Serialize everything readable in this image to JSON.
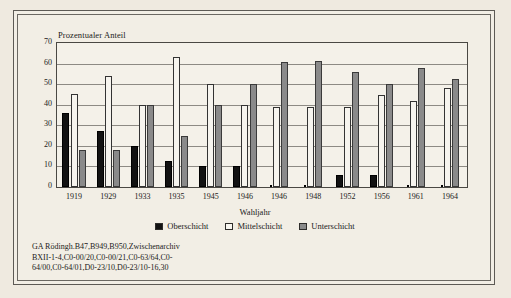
{
  "chart_data": {
    "type": "bar",
    "title": "",
    "ylabel": "Prozentualer Anteil",
    "xlabel": "Wahljahr",
    "ylim": [
      0,
      70
    ],
    "yticks": [
      70,
      60,
      50,
      40,
      30,
      20,
      10,
      0
    ],
    "grid": true,
    "legend_position": "bottom",
    "categories": [
      "1919",
      "1929",
      "1933",
      "1935",
      "1945",
      "1946",
      "1946",
      "1948",
      "1952",
      "1956",
      "1961",
      "1964"
    ],
    "series": [
      {
        "name": "Oberschicht",
        "color": "#121212",
        "values": [
          36,
          27,
          20,
          12.5,
          10,
          10,
          0,
          0,
          6,
          6,
          0,
          0
        ]
      },
      {
        "name": "Mittelschicht",
        "color": "#f6f4ee",
        "values": [
          45,
          54,
          40,
          63,
          50,
          40,
          39,
          39,
          39,
          44.5,
          42,
          48
        ]
      },
      {
        "name": "Unterschicht",
        "color": "#8a8a8a",
        "values": [
          18,
          18,
          40,
          25,
          40,
          50,
          61,
          61.5,
          56,
          50,
          58,
          52.5
        ]
      }
    ]
  },
  "caption": {
    "lines": [
      "GA Rödingh.B47,B949,B950,Zwischenarchiv",
      "BXII-1-4,C0-00/20,C0-00/21,C0-63/64,C0-",
      "64/00,C0-64/01,D0-23/10,D0-23/10-16,30"
    ]
  }
}
